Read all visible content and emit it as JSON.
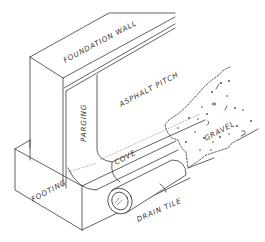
{
  "diagram": {
    "type": "isometric cross-section drawing",
    "colors": {
      "line": "#3a3a3a",
      "background": "#ffffff"
    },
    "labels": {
      "foundation_wall": "FOUNDATION WALL",
      "asphalt_pitch": "ASPHALT PITCH",
      "parging": "PARGING",
      "gravel": "GRAVEL",
      "cove": "COVE",
      "footing": "FOOTING",
      "drain_tile": "DRAIN TILE"
    }
  }
}
